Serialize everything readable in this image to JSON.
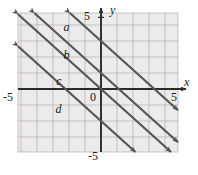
{
  "figure": {
    "kind": "coordinate-grid-graph",
    "background": "#ffffff",
    "grid_fill": "#ebebeb",
    "grid_line_color": "#b9a9a9",
    "axis_color": "#2b2b2b",
    "line_color": "#55555a",
    "label_color": "#1a1a1a"
  },
  "axes": {
    "x_label": "x",
    "y_label": "y",
    "origin_label": "0",
    "x_min_label": "-5",
    "x_max_label": "5",
    "y_min_label": "-5",
    "y_max_label": "5",
    "x_range": [
      -5.2,
      4.85
    ],
    "y_range": [
      -4.0,
      4.75
    ],
    "grid_step": 1,
    "grid": true
  },
  "chart_data": {
    "type": "line",
    "title": "",
    "xlabel": "x",
    "ylabel": "y",
    "xlim": [
      -5.2,
      4.85
    ],
    "ylim": [
      -4.0,
      4.75
    ],
    "grid": true,
    "legend": "inline-labels",
    "series": [
      {
        "name": "a",
        "label": "a",
        "slope": -0.9,
        "intercept": 3.0,
        "label_x": -2.35,
        "label_y": 4.25,
        "arrows": "both"
      },
      {
        "name": "b",
        "label": "b",
        "slope": -0.9,
        "intercept": 1.0,
        "label_x": -2.35,
        "label_y": 2.5,
        "arrows": "both"
      },
      {
        "name": "c",
        "label": "c",
        "slope": -0.9,
        "intercept": 0.0,
        "label_x": -2.8,
        "label_y": 0.9,
        "arrows": "both"
      },
      {
        "name": "d",
        "label": "d",
        "slope": -0.9,
        "intercept": -2.0,
        "label_x": -2.85,
        "label_y": -0.9,
        "arrows": "both"
      }
    ]
  }
}
